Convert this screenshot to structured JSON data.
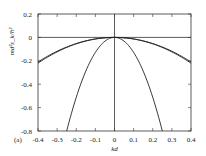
{
  "chart_data": {
    "type": "line",
    "panel_label": "(a)",
    "title": "",
    "xlabel": "kd",
    "ylabel": "md²ε_k/ħ²",
    "xlim": [
      -0.4,
      0.4
    ],
    "ylim": [
      -0.8,
      0.2
    ],
    "xticks": [
      "-0.4",
      "-0.3",
      "-0.2",
      "-0.1",
      "0",
      "0.1",
      "0.2",
      "0.3",
      "0.4"
    ],
    "yticks": [
      "0.2",
      "0",
      "-0.2",
      "-0.4",
      "-0.6",
      "-0.8"
    ],
    "grid": false,
    "legend": null,
    "series": [
      {
        "name": "outer branch 1",
        "x": [
          -0.4,
          -0.3,
          -0.2,
          -0.1,
          0,
          0.1,
          0.2,
          0.3,
          0.4
        ],
        "y": [
          -0.21,
          -0.13,
          -0.065,
          -0.018,
          0,
          -0.018,
          -0.065,
          -0.13,
          -0.21
        ]
      },
      {
        "name": "outer branch 2",
        "x": [
          -0.4,
          -0.3,
          -0.2,
          -0.1,
          0,
          0.1,
          0.2,
          0.3,
          0.4
        ],
        "y": [
          -0.22,
          -0.135,
          -0.068,
          -0.02,
          0,
          -0.02,
          -0.068,
          -0.135,
          -0.22
        ]
      },
      {
        "name": "inner parabola",
        "x": [
          -0.25,
          -0.2,
          -0.1,
          0,
          0.1,
          0.2,
          0.25
        ],
        "y": [
          -0.8,
          -0.51,
          -0.128,
          0,
          -0.128,
          -0.51,
          -0.8
        ]
      }
    ],
    "reference_lines": [
      {
        "type": "horizontal",
        "y": 0
      },
      {
        "type": "vertical",
        "x": 0
      }
    ]
  }
}
